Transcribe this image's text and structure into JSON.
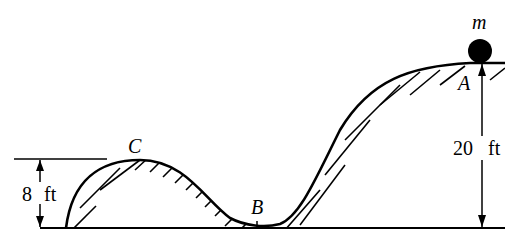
{
  "diagram": {
    "type": "roller-coaster track profile",
    "mass_label": "m",
    "points": {
      "A": "A",
      "B": "B",
      "C": "C"
    },
    "dimensions": {
      "left_height": {
        "value": "8",
        "unit": "ft"
      },
      "right_height": {
        "value": "20",
        "unit": "ft"
      }
    },
    "colors": {
      "ink": "#000000",
      "background": "#ffffff"
    }
  }
}
